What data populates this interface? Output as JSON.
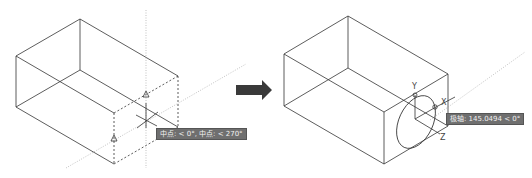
{
  "figure": {
    "left_panel": {
      "tooltip": "中点: < 0°, 中点: < 270°"
    },
    "right_panel": {
      "tooltip": "极轴: 145.0494 < 0°",
      "axis_labels": {
        "x": "X",
        "y": "Y",
        "z": "Z"
      }
    },
    "arrow": {
      "direction": "right",
      "color": "#3a3a3a"
    },
    "colors": {
      "line": "#333333",
      "dotted": "#888888",
      "tooltip_bg": "#6f6f6f"
    }
  }
}
